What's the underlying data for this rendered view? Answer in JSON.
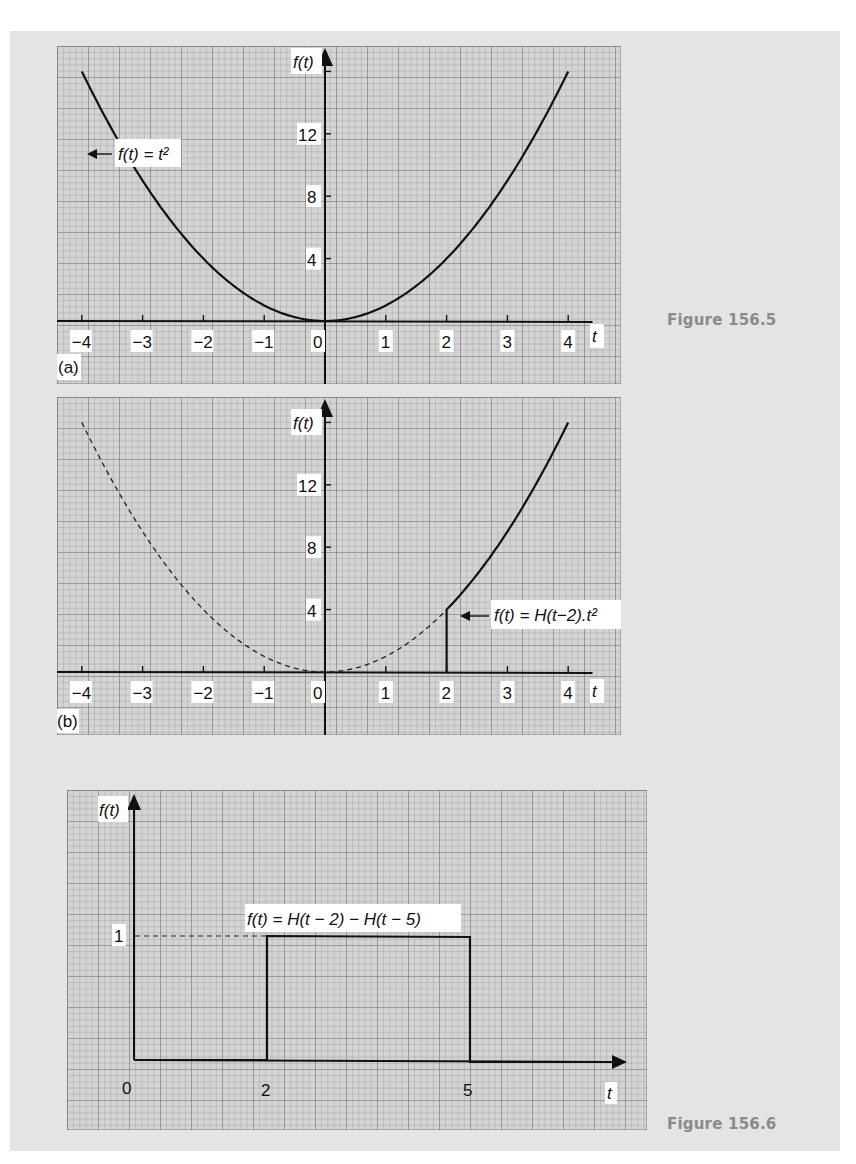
{
  "page": {
    "captions": {
      "fig_156_5": "Figure 156.5",
      "fig_156_6": "Figure 156.6"
    },
    "colors": {
      "background": "#e4e4e4",
      "grid_paper": "#d2d2d2",
      "grid_line": "#8f8f8f",
      "curve": "#111111",
      "caption": "#8a8a8a"
    }
  },
  "panels": {
    "a": {
      "tag": "(a)",
      "ylabel": "f(t)",
      "xlabel": "t",
      "xticks": [
        "−4",
        "−3",
        "−2",
        "−1",
        "0",
        "1",
        "2",
        "3",
        "4"
      ],
      "yticks": [
        "4",
        "8",
        "12"
      ],
      "annotation": "f(t) = t²"
    },
    "b": {
      "tag": "(b)",
      "ylabel": "f(t)",
      "xlabel": "t",
      "xticks": [
        "−4",
        "−3",
        "−2",
        "−1",
        "0",
        "1",
        "2",
        "3",
        "4"
      ],
      "yticks": [
        "4",
        "8",
        "12"
      ],
      "annotation": "f(t) = H(t−2).t²"
    },
    "c": {
      "ylabel": "f(t)",
      "xlabel": "t",
      "xticks": [
        "0",
        "2",
        "5"
      ],
      "yticks": [
        "1"
      ],
      "annotation": "f(t) = H(t − 2) − H(t − 5)"
    }
  },
  "chart_data": [
    {
      "type": "line",
      "title": "(a) f(t) = t²",
      "figure": "Figure 156.5",
      "xlabel": "t",
      "ylabel": "f(t)",
      "xlim": [
        -4.4,
        4.4
      ],
      "ylim": [
        -3.5,
        18
      ],
      "xticks": [
        -4,
        -3,
        -2,
        -1,
        0,
        1,
        2,
        3,
        4
      ],
      "yticks": [
        4,
        8,
        12
      ],
      "grid": true,
      "series": [
        {
          "name": "f(t) = t²",
          "style": "solid",
          "x": [
            -4,
            -3.5,
            -3,
            -2.5,
            -2,
            -1.5,
            -1,
            -0.5,
            0,
            0.5,
            1,
            1.5,
            2,
            2.5,
            3,
            3.5,
            4
          ],
          "y": [
            16,
            12.25,
            9,
            6.25,
            4,
            2.25,
            1,
            0.25,
            0,
            0.25,
            1,
            2.25,
            4,
            6.25,
            9,
            12.25,
            16
          ]
        }
      ]
    },
    {
      "type": "line",
      "title": "(b) f(t) = H(t−2).t²",
      "figure": "Figure 156.5",
      "xlabel": "t",
      "ylabel": "f(t)",
      "xlim": [
        -4.4,
        4.4
      ],
      "ylim": [
        -3.5,
        18
      ],
      "xticks": [
        -4,
        -3,
        -2,
        -1,
        0,
        1,
        2,
        3,
        4
      ],
      "yticks": [
        4,
        8,
        12
      ],
      "grid": true,
      "series": [
        {
          "name": "t² (reference, dashed)",
          "style": "dashed",
          "x": [
            -4,
            -3,
            -2,
            -1,
            0,
            1,
            2
          ],
          "y": [
            16,
            9,
            4,
            1,
            0,
            1,
            4
          ]
        },
        {
          "name": "f(t) = H(t−2).t²",
          "style": "solid",
          "x": [
            -4.4,
            2,
            2,
            2.5,
            3,
            3.5,
            4
          ],
          "y": [
            0,
            0,
            4,
            6.25,
            9,
            12.25,
            16
          ]
        }
      ]
    },
    {
      "type": "line",
      "title": "f(t) = H(t − 2) − H(t − 5)",
      "figure": "Figure 156.6",
      "xlabel": "t",
      "ylabel": "f(t)",
      "xlim": [
        0,
        7
      ],
      "ylim": [
        0,
        1.6
      ],
      "xticks": [
        0,
        2,
        5
      ],
      "yticks": [
        1
      ],
      "grid": true,
      "series": [
        {
          "name": "f(t) = H(t − 2) − H(t − 5)",
          "style": "solid",
          "x": [
            0,
            2,
            2,
            5,
            5,
            7
          ],
          "y": [
            0,
            0,
            1,
            1,
            0,
            0
          ]
        },
        {
          "name": "level guide",
          "style": "dashed",
          "x": [
            0,
            2
          ],
          "y": [
            1,
            1
          ]
        }
      ]
    }
  ]
}
